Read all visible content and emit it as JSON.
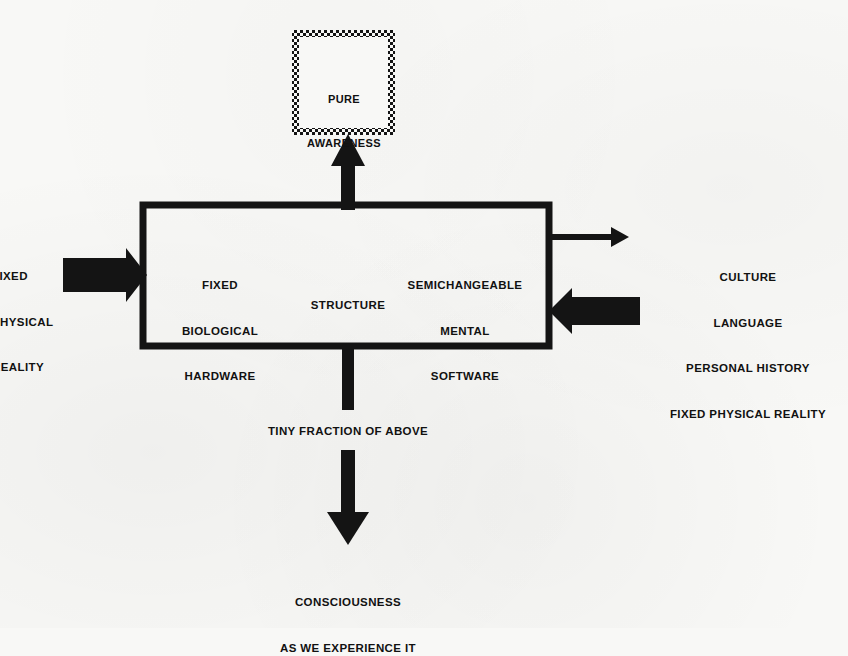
{
  "diagram": {
    "background_color": "#f8f8f6",
    "ink_color": "#111111",
    "nodes": {
      "pure_awareness": {
        "label_line1": "PURE",
        "label_line2": "AWARENESS",
        "border_style": "stippled",
        "x": 292,
        "y": 30,
        "w": 103,
        "h": 105
      },
      "main_box": {
        "x": 143,
        "y": 205,
        "w": 406,
        "h": 141,
        "border_style": "solid-thick",
        "compartments": [
          {
            "name": "fixed-biological-hardware",
            "lines": [
              "FIXED",
              "BIOLOGICAL",
              "HARDWARE"
            ]
          },
          {
            "name": "structure",
            "lines": [
              "STRUCTURE"
            ]
          },
          {
            "name": "semichangeable-mental-software",
            "lines": [
              "SEMICHANGEABLE",
              "MENTAL",
              "SOFTWARE"
            ]
          }
        ]
      }
    },
    "labels": {
      "left_input": {
        "lines": [
          "FIXED",
          "PHYSICAL",
          "REALITY"
        ],
        "clipped": true,
        "note": "clipped at left image edge"
      },
      "right_input": {
        "lines": [
          "CULTURE",
          "LANGUAGE",
          "PERSONAL HISTORY",
          "FIXED PHYSICAL REALITY"
        ]
      },
      "tiny_fraction": "TINY FRACTION OF ABOVE",
      "consciousness": {
        "lines": [
          "CONSCIOUSNESS",
          "AS WE EXPERIENCE IT"
        ]
      }
    },
    "arrows": [
      {
        "name": "arrow-up-to-pure-awareness",
        "direction": "up",
        "style": "thick-stroke"
      },
      {
        "name": "arrow-in-from-left",
        "direction": "right",
        "style": "block"
      },
      {
        "name": "arrow-in-from-right",
        "direction": "left",
        "style": "block"
      },
      {
        "name": "arrow-out-to-right",
        "direction": "right",
        "style": "thin-stroke"
      },
      {
        "name": "arrow-down-stub",
        "direction": "down",
        "style": "stub"
      },
      {
        "name": "arrow-down-to-consciousness",
        "direction": "down",
        "style": "thick-stroke"
      }
    ]
  }
}
